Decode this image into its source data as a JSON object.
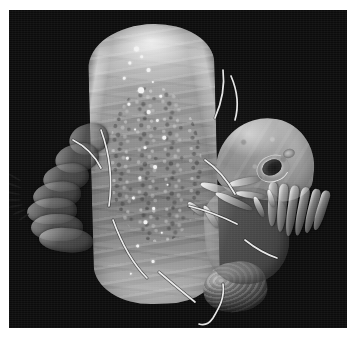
{
  "figure": {
    "kind": "sem-micrograph",
    "modality": "Scanning electron microscopy",
    "color_mode": "grayscale",
    "orientation": "head toward lower right, posterior abdomen toward upper left",
    "caption": "",
    "scale_bar_label": "",
    "magnification_label": "",
    "annotations": []
  },
  "canvas": {
    "width_px": 355,
    "height_px": 344,
    "page_background": "#ffffff"
  },
  "panel": {
    "left_px": 9,
    "top_px": 10,
    "width_px": 338,
    "height_px": 318,
    "background": "#0c0c0c",
    "border": "none"
  },
  "palette": {
    "background_black": "#0c0c0c",
    "specimen_highlight": "#f5f5f5",
    "specimen_midtone": "#9b9b9b",
    "specimen_shadow": "#4a4a4a",
    "eye_dark": "#141414",
    "frame_white": "#ffffff"
  },
  "structures": [
    {
      "name": "trunk",
      "label": "Abdominal trunk with wrinkled cuticle",
      "region": "center-left, vertical"
    },
    {
      "name": "head-capsule",
      "label": "Head capsule",
      "region": "right of center"
    },
    {
      "name": "eye-spot",
      "label": "Eye spot (stemma)",
      "region": "head, posterolateral"
    },
    {
      "name": "ocellus",
      "label": "Secondary ocellus",
      "region": "head, dorsal to stemma"
    },
    {
      "name": "segment-stack",
      "label": "Posterior body segments with setae",
      "region": "far left"
    },
    {
      "name": "thorax-block",
      "label": "Thoracic region with appendages",
      "region": "lower right of trunk"
    },
    {
      "name": "ventral-ribs",
      "label": "Segmented ventral plates",
      "region": "below head"
    },
    {
      "name": "caudal-lobe",
      "label": "Shaded terminal lobe",
      "region": "bottom center-right"
    },
    {
      "name": "seta-filaments",
      "label": "Setae / cuticular filaments",
      "region": "multiple, left margin and bottom"
    }
  ],
  "specks": [
    {
      "x": 46,
      "y": 22,
      "r": 2.4
    },
    {
      "x": 52,
      "y": 31,
      "r": 1.6
    },
    {
      "x": 40,
      "y": 37,
      "r": 1.3
    },
    {
      "x": 58,
      "y": 44,
      "r": 2.0
    },
    {
      "x": 34,
      "y": 52,
      "r": 1.4
    },
    {
      "x": 63,
      "y": 57,
      "r": 1.2
    },
    {
      "x": 49,
      "y": 63,
      "r": 2.8
    },
    {
      "x": 70,
      "y": 71,
      "r": 1.5
    },
    {
      "x": 38,
      "y": 78,
      "r": 1.3
    },
    {
      "x": 57,
      "y": 86,
      "r": 2.2
    },
    {
      "x": 66,
      "y": 95,
      "r": 1.6
    },
    {
      "x": 44,
      "y": 104,
      "r": 1.2
    },
    {
      "x": 72,
      "y": 112,
      "r": 1.8
    },
    {
      "x": 53,
      "y": 122,
      "r": 1.3
    },
    {
      "x": 35,
      "y": 132,
      "r": 1.5
    },
    {
      "x": 62,
      "y": 141,
      "r": 2.1
    },
    {
      "x": 47,
      "y": 152,
      "r": 1.4
    },
    {
      "x": 75,
      "y": 160,
      "r": 1.2
    },
    {
      "x": 40,
      "y": 172,
      "r": 1.7
    },
    {
      "x": 60,
      "y": 183,
      "r": 1.3
    },
    {
      "x": 51,
      "y": 196,
      "r": 1.9
    },
    {
      "x": 68,
      "y": 208,
      "r": 1.2
    },
    {
      "x": 43,
      "y": 220,
      "r": 1.5
    },
    {
      "x": 58,
      "y": 236,
      "r": 1.3
    },
    {
      "x": 36,
      "y": 248,
      "r": 1.1
    }
  ],
  "segment_lobes": [
    {
      "left": 44,
      "top": 0,
      "w": 40,
      "h": 30,
      "rot": -16
    },
    {
      "left": 30,
      "top": 20,
      "w": 44,
      "h": 28,
      "rot": -13
    },
    {
      "left": 18,
      "top": 40,
      "w": 46,
      "h": 27,
      "rot": -10
    },
    {
      "left": 8,
      "top": 58,
      "w": 48,
      "h": 26,
      "rot": -7
    },
    {
      "left": 2,
      "top": 74,
      "w": 50,
      "h": 26,
      "rot": -4
    },
    {
      "left": 6,
      "top": 90,
      "w": 52,
      "h": 27,
      "rot": 0
    },
    {
      "left": 14,
      "top": 104,
      "w": 54,
      "h": 24,
      "rot": 4
    }
  ],
  "ribs": [
    {
      "left": 0,
      "rot": -7,
      "h": 82
    },
    {
      "left": 10,
      "rot": -4,
      "h": 88
    },
    {
      "left": 20,
      "rot": -1,
      "h": 94
    },
    {
      "left": 30,
      "rot": 2,
      "h": 90
    },
    {
      "left": 40,
      "rot": 5,
      "h": 84
    },
    {
      "left": 49,
      "rot": 8,
      "h": 76
    }
  ],
  "appendages": [
    {
      "left": 200,
      "top": 186,
      "w": 44,
      "h": 8,
      "rot": 16
    },
    {
      "left": 214,
      "top": 198,
      "w": 40,
      "h": 7,
      "rot": 24
    },
    {
      "left": 228,
      "top": 178,
      "w": 34,
      "h": 7,
      "rot": -12
    },
    {
      "left": 236,
      "top": 192,
      "w": 30,
      "h": 6,
      "rot": 8
    },
    {
      "left": 198,
      "top": 214,
      "w": 26,
      "h": 6,
      "rot": 58
    },
    {
      "left": 248,
      "top": 204,
      "w": 22,
      "h": 6,
      "rot": 66
    },
    {
      "left": 262,
      "top": 196,
      "w": 18,
      "h": 5,
      "rot": 72
    },
    {
      "left": 186,
      "top": 206,
      "w": 20,
      "h": 6,
      "rot": 40
    }
  ],
  "bristles": [
    {
      "left": 6,
      "top": 176,
      "w": 16,
      "h": 2.2,
      "rot": 30
    },
    {
      "left": 4,
      "top": 184,
      "w": 18,
      "h": 2.0,
      "rot": 20
    },
    {
      "left": 3,
      "top": 192,
      "w": 18,
      "h": 2.0,
      "rot": 10
    },
    {
      "left": 5,
      "top": 199,
      "w": 16,
      "h": 2.0,
      "rot": 0
    },
    {
      "left": 8,
      "top": 205,
      "w": 15,
      "h": 2.0,
      "rot": -10
    },
    {
      "left": 12,
      "top": 211,
      "w": 14,
      "h": 2.0,
      "rot": -22
    },
    {
      "left": 18,
      "top": 216,
      "w": 12,
      "h": 2.0,
      "rot": -34
    }
  ],
  "setae_paths": [
    "M 214 60 C 216 76, 212 94, 206 108",
    "M 222 66 C 228 80, 230 96, 226 110",
    "M 196 150 C 208 158, 218 170, 226 184",
    "M 180 196 C 196 200, 212 206, 228 214",
    "M 92 120 C 100 142, 104 168, 100 196",
    "M 104 210 C 112 232, 122 252, 138 268",
    "M 150 262 C 164 274, 176 284, 186 292",
    "M 214 274 C 216 288, 210 298, 204 308 C 200 314, 196 316, 190 314",
    "M 236 230 C 246 238, 256 244, 268 248",
    "M 64 130 C 76 136, 86 146, 92 158"
  ]
}
